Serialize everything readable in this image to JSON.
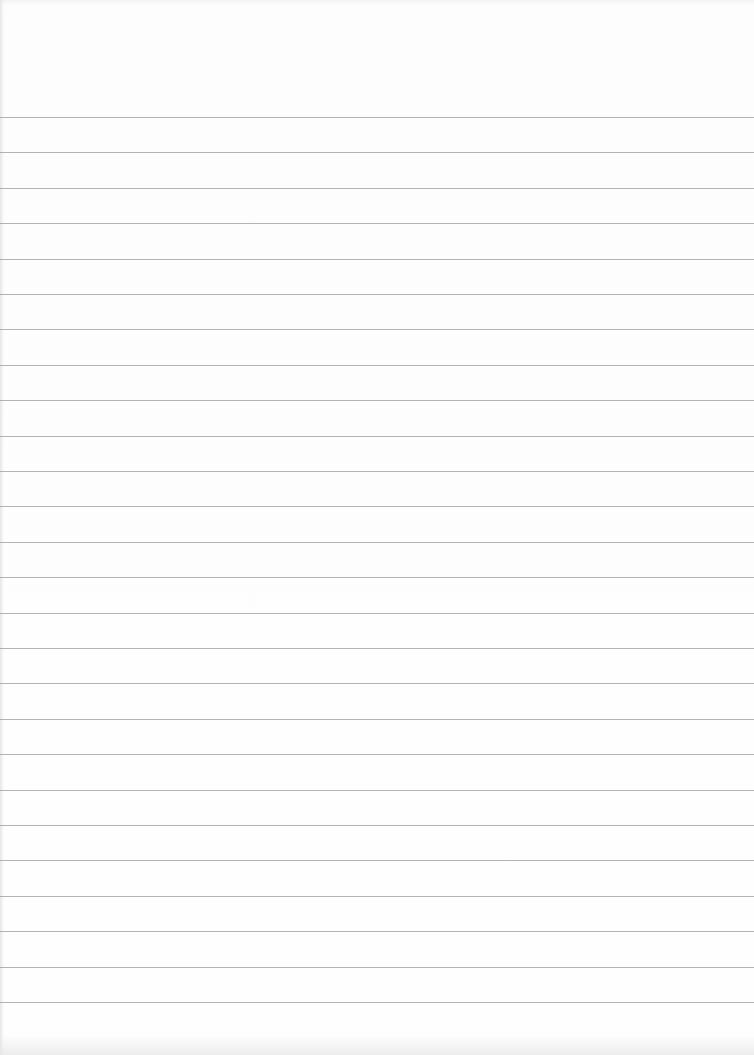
{
  "page": {
    "type": "blank-ruled-paper",
    "background_color": "#fdfdfd",
    "rule_color": "#9a9a9a",
    "rule_count": 26,
    "first_rule_y": 117,
    "rule_spacing_px": 35.4
  }
}
